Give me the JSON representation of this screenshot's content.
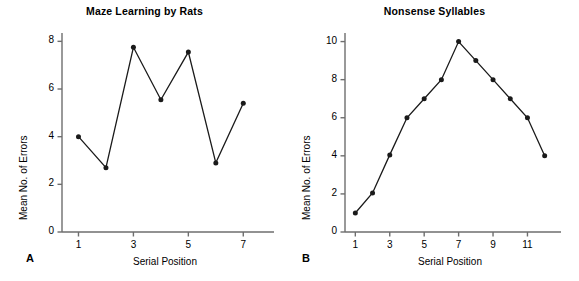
{
  "figure": {
    "background": "#ffffff",
    "line_color": "#1a1a1a",
    "axis_color": "#6e6e6e",
    "text_color": "#000000"
  },
  "panels": [
    {
      "letter": "A",
      "title": "Maze Learning by Rats",
      "xlabel": "Serial Position",
      "ylabel": "Mean No. of Errors"
    },
    {
      "letter": "B",
      "title": "Nonsense Syllables",
      "xlabel": "Serial Position",
      "ylabel": "Mean No. of Errors"
    }
  ],
  "chart_data": [
    {
      "type": "line",
      "title": "Maze Learning by Rats",
      "panel_letter": "A",
      "xlabel": "Serial Position",
      "ylabel": "Mean No. of Errors",
      "x": [
        1,
        2,
        3,
        4,
        5,
        6,
        7
      ],
      "values": [
        4.0,
        2.7,
        7.75,
        5.55,
        7.55,
        2.9,
        5.4
      ],
      "xlim": [
        0.4,
        7.9
      ],
      "ylim": [
        0,
        8.35
      ],
      "xticks": [
        1,
        3,
        5,
        7
      ],
      "xtick_labels": [
        "1",
        "3",
        "5",
        "7"
      ],
      "yticks": [
        0,
        2,
        4,
        6,
        8
      ],
      "ytick_labels": [
        "0",
        "2",
        "4",
        "6",
        "8"
      ],
      "grid": false,
      "markers": "filled-circle",
      "legend": null
    },
    {
      "type": "line",
      "title": "Nonsense Syllables",
      "panel_letter": "B",
      "xlabel": "Serial Position",
      "ylabel": "Mean No. of Errors",
      "x": [
        1,
        2,
        3,
        4,
        5,
        6,
        7,
        8,
        9,
        10,
        11,
        12
      ],
      "values": [
        1.0,
        2.05,
        4.05,
        6.0,
        7.0,
        8.0,
        10.0,
        9.0,
        8.0,
        7.0,
        6.0,
        4.0
      ],
      "xlim": [
        0.4,
        12.6
      ],
      "ylim": [
        0,
        10.45
      ],
      "xticks": [
        1,
        3,
        5,
        7,
        9,
        11
      ],
      "xtick_labels": [
        "1",
        "3",
        "5",
        "7",
        "9",
        "11"
      ],
      "yticks": [
        0,
        2,
        4,
        6,
        8,
        10
      ],
      "ytick_labels": [
        "0",
        "2",
        "4",
        "6",
        "8",
        "10"
      ],
      "grid": false,
      "markers": "filled-circle",
      "legend": null
    }
  ]
}
